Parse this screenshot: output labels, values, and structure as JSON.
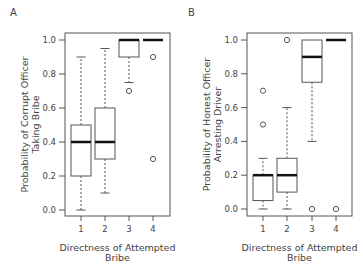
{
  "chart_data": [
    {
      "panel": "A",
      "type": "boxplot",
      "title": "",
      "xlabel": "Directness of Attempted Bribe",
      "ylabel": "Probability of Corrupt Officer Taking Bribe",
      "ylabel_lines": [
        "Probability of Corrupt Officer",
        "Taking Bribe"
      ],
      "xlabel_lines": [
        "Directness of Attempted",
        "Bribe"
      ],
      "categories": [
        "1",
        "2",
        "3",
        "4"
      ],
      "yticks": [
        "0.0",
        "0.2",
        "0.4",
        "0.6",
        "0.8",
        "1.0"
      ],
      "ylim": [
        0,
        1
      ],
      "grid": false,
      "boxes": [
        {
          "x": "1",
          "whisker_low": 0.0,
          "q1": 0.2,
          "median": 0.4,
          "q3": 0.5,
          "whisker_high": 0.9,
          "outliers": []
        },
        {
          "x": "2",
          "whisker_low": 0.1,
          "q1": 0.3,
          "median": 0.4,
          "q3": 0.6,
          "whisker_high": 0.95,
          "outliers": []
        },
        {
          "x": "3",
          "whisker_low": 0.75,
          "q1": 0.9,
          "median": 1.0,
          "q3": 1.0,
          "whisker_high": 1.0,
          "outliers": [
            0.7
          ]
        },
        {
          "x": "4",
          "whisker_low": 1.0,
          "q1": 1.0,
          "median": 1.0,
          "q3": 1.0,
          "whisker_high": 1.0,
          "outliers": [
            0.9,
            0.3
          ]
        }
      ]
    },
    {
      "panel": "B",
      "type": "boxplot",
      "title": "",
      "xlabel": "Directness of Attempted Bribe",
      "ylabel": "Probability of Honest Officer Arresting Driver",
      "ylabel_lines": [
        "Probability of Honest Officer",
        "Arresting Driver"
      ],
      "xlabel_lines": [
        "Directness of Attempted",
        "Bribe"
      ],
      "categories": [
        "1",
        "2",
        "3",
        "4"
      ],
      "yticks": [
        "0.0",
        "0.2",
        "0.4",
        "0.6",
        "0.8",
        "1.0"
      ],
      "ylim": [
        0,
        1
      ],
      "grid": false,
      "boxes": [
        {
          "x": "1",
          "whisker_low": 0.0,
          "q1": 0.05,
          "median": 0.2,
          "q3": 0.2,
          "whisker_high": 0.3,
          "outliers": [
            0.7,
            0.5
          ]
        },
        {
          "x": "2",
          "whisker_low": 0.0,
          "q1": 0.1,
          "median": 0.2,
          "q3": 0.3,
          "whisker_high": 0.6,
          "outliers": [
            1.0
          ]
        },
        {
          "x": "3",
          "whisker_low": 0.4,
          "q1": 0.75,
          "median": 0.9,
          "q3": 1.0,
          "whisker_high": 1.0,
          "outliers": [
            0.0
          ]
        },
        {
          "x": "4",
          "whisker_low": 1.0,
          "q1": 1.0,
          "median": 1.0,
          "q3": 1.0,
          "whisker_high": 1.0,
          "outliers": [
            0.0
          ]
        }
      ]
    }
  ],
  "panels": {
    "a": {
      "letter": "A"
    },
    "b": {
      "letter": "B"
    }
  }
}
